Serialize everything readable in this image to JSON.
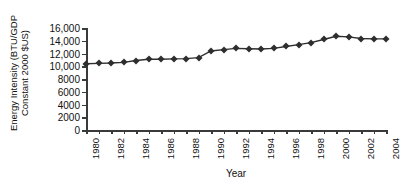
{
  "chart_data": {
    "type": "line",
    "title": "",
    "xlabel": "Year",
    "ylabel_line1": "Energy Intensity (BTU/GDP",
    "ylabel_line2": "Constant 2000 $US)",
    "ylim": [
      0,
      16000
    ],
    "ytick_values": [
      0,
      2000,
      4000,
      6000,
      8000,
      10000,
      12000,
      14000,
      16000
    ],
    "ytick_labels": [
      "0",
      "2000",
      "4000",
      "6000",
      "8000",
      "10,000",
      "12,000",
      "14,000",
      "16,000"
    ],
    "xlim": [
      1980,
      2004
    ],
    "xtick_values": [
      1980,
      1981,
      1982,
      1983,
      1984,
      1985,
      1986,
      1987,
      1988,
      1989,
      1990,
      1991,
      1992,
      1993,
      1994,
      1995,
      1996,
      1997,
      1998,
      1999,
      2000,
      2001,
      2002,
      2003,
      2004
    ],
    "xtick_labels": [
      "1980",
      "1982",
      "1984",
      "1986",
      "1988",
      "1990",
      "1992",
      "1994",
      "1996",
      "1998",
      "2000",
      "2002",
      "2004"
    ],
    "xtick_label_values": [
      1980,
      1982,
      1984,
      1986,
      1988,
      1990,
      1992,
      1994,
      1996,
      1998,
      2000,
      2002,
      2004
    ],
    "grid": false,
    "legend": false,
    "marker": "diamond",
    "series_color": "#2e2e2e",
    "axis_color": "#3a3a3a",
    "x": [
      1980,
      1981,
      1982,
      1983,
      1984,
      1985,
      1986,
      1987,
      1988,
      1989,
      1990,
      1991,
      1992,
      1993,
      1994,
      1995,
      1996,
      1997,
      1998,
      1999,
      2000,
      2001,
      2002,
      2003,
      2004
    ],
    "values": [
      10400,
      10450,
      10500,
      10600,
      10900,
      11100,
      11100,
      11150,
      11200,
      11350,
      12400,
      12600,
      12800,
      12750,
      12700,
      12800,
      13100,
      13400,
      13700,
      14200,
      14700,
      14600,
      14350,
      14300,
      14300
    ]
  }
}
